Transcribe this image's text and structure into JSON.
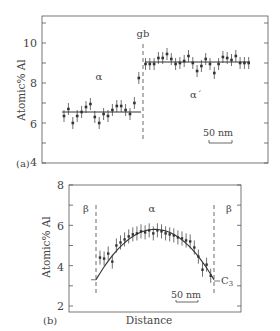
{
  "chart_data": [
    {
      "panel": "(a)",
      "type": "scatter",
      "title": "",
      "xlabel": "",
      "ylabel": "Atomic% Al",
      "ylim": [
        4,
        11
      ],
      "yticks": [
        4,
        6,
        8,
        10
      ],
      "grid": false,
      "annotations": [
        {
          "text": "gb",
          "role": "grain boundary (dashed vertical line)"
        },
        {
          "text": "α",
          "role": "left phase label"
        },
        {
          "text": "α´",
          "role": "right phase label"
        },
        {
          "text": "50 nm",
          "role": "scale bar"
        }
      ],
      "fit_lines": [
        {
          "name": "α mean",
          "value": 6.55
        },
        {
          "name": "α´ mean",
          "value": 9.05
        }
      ],
      "series": [
        {
          "name": "α",
          "x": [
            1,
            2,
            3,
            4,
            5,
            6,
            7,
            8,
            9,
            10,
            11,
            12,
            13,
            14,
            15,
            16,
            17,
            18
          ],
          "values": [
            6.35,
            6.7,
            6.0,
            6.35,
            6.55,
            6.8,
            6.95,
            6.3,
            6.0,
            6.45,
            6.35,
            6.65,
            6.85,
            6.85,
            6.65,
            6.45,
            7.0,
            8.25
          ],
          "error": 0.3
        },
        {
          "name": "α´",
          "x": [
            19,
            20,
            21,
            22,
            23,
            24,
            25,
            26,
            27,
            28,
            29,
            30,
            31,
            32,
            33,
            34,
            35,
            36,
            37,
            38,
            39,
            40,
            41,
            42,
            43
          ],
          "values": [
            8.95,
            8.95,
            8.95,
            9.25,
            9.25,
            9.45,
            9.2,
            8.95,
            9.0,
            9.1,
            9.35,
            9.0,
            8.6,
            8.85,
            9.2,
            8.95,
            8.5,
            8.95,
            9.3,
            9.25,
            9.15,
            9.35,
            9.0,
            9.0,
            9.0
          ],
          "error": 0.3
        }
      ]
    },
    {
      "panel": "(b)",
      "type": "scatter",
      "title": "",
      "xlabel": "Distance",
      "ylabel": "Atomic% Al",
      "ylim": [
        2,
        8
      ],
      "yticks": [
        2,
        4,
        6,
        8
      ],
      "grid": false,
      "annotations": [
        {
          "text": "β",
          "role": "left phase label"
        },
        {
          "text": "α",
          "role": "center phase label"
        },
        {
          "text": "β",
          "role": "right phase label"
        },
        {
          "text": "C₃",
          "role": "boundary concentration label"
        },
        {
          "text": "50 nm",
          "role": "scale bar"
        }
      ],
      "fit_curve": {
        "shape": "parabolic",
        "peak": 5.8,
        "ends": 3.3
      },
      "series": [
        {
          "name": "α profile",
          "x": [
            1,
            2,
            3,
            4,
            5,
            6,
            7,
            8,
            9,
            10,
            11,
            12,
            13,
            14,
            15,
            16,
            17,
            18,
            19,
            20,
            21,
            22,
            23,
            24,
            25,
            26,
            27,
            28
          ],
          "values": [
            4.4,
            4.35,
            4.6,
            4.2,
            5.0,
            5.15,
            5.3,
            5.45,
            5.55,
            5.6,
            5.7,
            5.65,
            5.75,
            5.6,
            5.75,
            5.7,
            5.6,
            5.55,
            5.5,
            5.4,
            5.35,
            5.25,
            5.2,
            4.9,
            4.45,
            3.8,
            4.05,
            3.5
          ],
          "error": 0.35
        }
      ]
    }
  ],
  "panels": {
    "a": {
      "label": "(a)",
      "ylabel": "Atomic% Al",
      "ytick_labels": [
        "10",
        "8",
        "6",
        "4"
      ],
      "gb_label": "gb",
      "alpha_label": "α",
      "alpha_prime_label": "α´",
      "scale_label": "50 nm"
    },
    "b": {
      "label": "(b)",
      "ylabel": "Atomic% Al",
      "xlabel": "Distance",
      "ytick_labels": [
        "8",
        "6",
        "4",
        "2"
      ],
      "beta_left": "β",
      "alpha_label": "α",
      "beta_right": "β",
      "c3_label": "C",
      "c3_sub": "3",
      "scale_label": "50 nm"
    }
  },
  "colors": {
    "ink": "#333333",
    "frame": "#555555",
    "background": "#ffffff"
  }
}
